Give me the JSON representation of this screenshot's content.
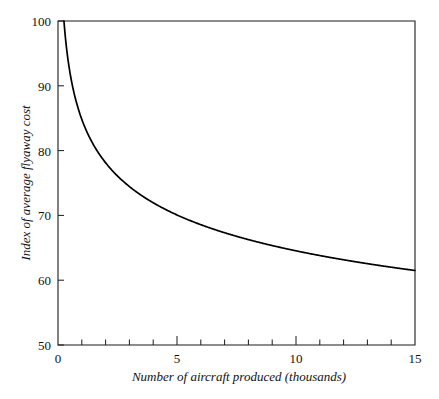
{
  "chart_data": {
    "type": "line",
    "title": "",
    "subtitle": "",
    "xlabel": "Number of aircraft produced (thousands)",
    "ylabel": "Index of average flyaway cost",
    "xlim": [
      0,
      15
    ],
    "ylim": [
      50,
      100
    ],
    "grid": false,
    "legend": null,
    "legend_position": "none",
    "x_ticks": [
      0,
      5,
      10,
      15
    ],
    "x_tick_labels": [
      "0",
      "5",
      "10",
      "15"
    ],
    "x_minor_tick_interval": 1,
    "y_ticks": [
      50,
      60,
      70,
      80,
      90,
      100
    ],
    "y_tick_labels": [
      "50",
      "60",
      "70",
      "80",
      "90",
      "100"
    ],
    "series": [
      {
        "name": "Index of average flyaway cost",
        "color": "#000000",
        "x": [
          0.25,
          0.5,
          0.75,
          1,
          1.5,
          2,
          2.5,
          3,
          3.5,
          4,
          4.5,
          5,
          5.5,
          6,
          6.5,
          7,
          7.5,
          8,
          8.5,
          9,
          9.5,
          10,
          10.5,
          11,
          11.5,
          12,
          12.5,
          13,
          13.5,
          14,
          14.5,
          15
        ],
        "values": [
          100,
          94.2,
          90.9,
          88.6,
          85.4,
          83.2,
          81.5,
          80.2,
          79.1,
          78.1,
          77.3,
          76.5,
          75.9,
          75.3,
          74.7,
          74.2,
          73.8,
          73.3,
          72.9,
          72.6,
          72.2,
          71.9,
          71.6,
          71.3,
          71.0,
          70.7,
          70.5,
          70.2,
          70.0,
          69.8,
          69.6,
          69.4
        ]
      }
    ],
    "annotations": []
  },
  "axes": {
    "y_label_text": "Index of average flyaway cost",
    "x_label_text": "Number of aircraft produced (thousands)",
    "y_tick_100": "100",
    "y_tick_90": "90",
    "y_tick_80": "80",
    "y_tick_70": "70",
    "y_tick_60": "60",
    "y_tick_50": "50",
    "x_tick_0": "0",
    "x_tick_5": "5",
    "x_tick_10": "10",
    "x_tick_15": "15"
  },
  "colors": {
    "curve": "#000000",
    "frame": "#1a1a1a",
    "text": "#111111",
    "background": "#ffffff"
  }
}
